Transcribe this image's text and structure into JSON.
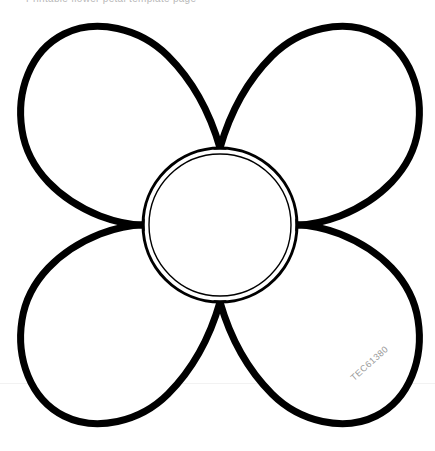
{
  "page": {
    "title": "Flower Petal Template",
    "background_color": "#ffffff",
    "width": 435,
    "height": 451
  },
  "header": {
    "clipped_browser_text": "Printable flower petal template page"
  },
  "watermark": {
    "text": "TEC61380",
    "color": "#9a9a9a",
    "rotation_deg": -42
  },
  "artwork": {
    "name": "four-petal-flower-outline",
    "description": "Black line-art outline of a four petal flower with a double ring center circle",
    "stroke_color": "#000000",
    "fill_color": "#ffffff",
    "petal_stroke_width": 7,
    "circle_outer_stroke_width": 3,
    "circle_inner_stroke_width": 1.4,
    "center": {
      "x": 220,
      "y": 225
    },
    "circle_outer_radius": 77,
    "circle_inner_radius": 71,
    "petals": [
      {
        "name": "petal-top-left",
        "tip_x": 56,
        "tip_y": 66
      },
      {
        "name": "petal-top-right",
        "tip_x": 384,
        "tip_y": 66
      },
      {
        "name": "petal-bottom-left",
        "tip_x": 56,
        "tip_y": 384
      },
      {
        "name": "petal-bottom-right",
        "tip_x": 384,
        "tip_y": 384
      }
    ],
    "junctions": [
      {
        "name": "junction-top",
        "x": 220,
        "y": 148
      },
      {
        "name": "junction-right",
        "x": 297,
        "y": 225
      },
      {
        "name": "junction-bottom",
        "x": 220,
        "y": 302
      },
      {
        "name": "junction-left",
        "x": 143,
        "y": 225
      }
    ]
  },
  "page_fold": {
    "color": "#f2f2f2",
    "y": 383
  }
}
